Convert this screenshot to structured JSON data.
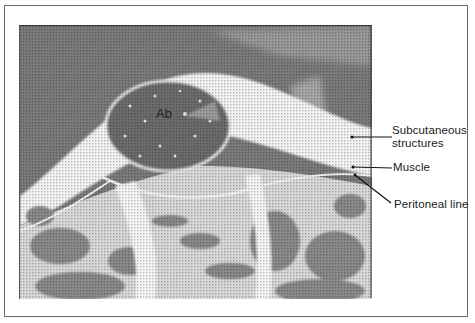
{
  "figure": {
    "type": "ultrasound image (grayscale, halftone)",
    "inner_label": "Ab",
    "annotations": [
      {
        "id": "subcutaneous",
        "lines": [
          "Subcutaneous",
          "structures"
        ]
      },
      {
        "id": "muscle",
        "lines": [
          "Muscle"
        ]
      },
      {
        "id": "peritoneal",
        "lines": [
          "Peritoneal line"
        ]
      }
    ]
  },
  "colors": {
    "frame_border": "#6a6a6a",
    "background_tissue": "#7a7a7a",
    "bright_echo": "#f4f4f4",
    "abscess_fill": "#6c6c6c",
    "text": "#1a1a1a"
  }
}
